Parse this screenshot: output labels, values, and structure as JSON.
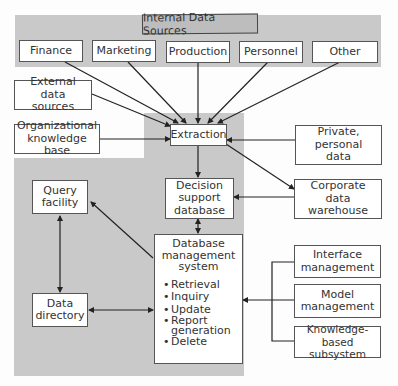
{
  "diagram": {
    "internal_group": {
      "title": "Internal Data Sources",
      "sources": [
        "Finance",
        "Marketing",
        "Production",
        "Personnel",
        "Other"
      ]
    },
    "external_sources": "External data sources",
    "org_knowledge": "Organizational knowledge base",
    "extraction": "Extraction",
    "private_data": "Private, personal data",
    "corporate_warehouse": "Corporate data warehouse",
    "decision_db": "Decision support database",
    "query_facility": "Query facility",
    "data_directory": "Data directory",
    "dbms": {
      "title": "Database management system",
      "functions": [
        "Retrieval",
        "Inquiry",
        "Update",
        "Report generation",
        "Delete"
      ]
    },
    "right_components": [
      "Interface management",
      "Model management",
      "Knowledge-based subsystem"
    ],
    "colors": {
      "gray_region": "#c9c9c9",
      "box_border": "#555555",
      "line": "#222222"
    }
  }
}
